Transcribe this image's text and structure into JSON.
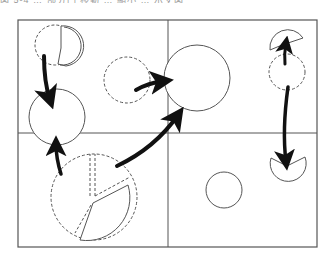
{
  "caption": {
    "text": "図 5-4 … 部分円 移動 … 縮小 … 示す図"
  },
  "diagram": {
    "type": "circle-transition-diagram",
    "frame": {
      "x": 18,
      "y": 20,
      "w": 299,
      "h": 227
    },
    "dividers": {
      "vertical_x": 168,
      "horizontal_y": 133
    },
    "colors": {
      "stroke": "#555555",
      "arrow": "#111111",
      "background": "#ffffff"
    },
    "shapes": [
      {
        "id": "tl-dashed-circle",
        "kind": "dashed-circle",
        "cx": 55,
        "cy": 45,
        "r": 20
      },
      {
        "id": "tl-pie-piece",
        "kind": "solid-sector"
      },
      {
        "id": "left-circle",
        "kind": "solid-circle",
        "cx": 57,
        "cy": 117,
        "r": 28
      },
      {
        "id": "mid-dashed-circle",
        "kind": "dashed-circle",
        "cx": 127,
        "cy": 80,
        "r": 23
      },
      {
        "id": "big-circle",
        "kind": "solid-circle",
        "cx": 197,
        "cy": 78,
        "r": 33
      },
      {
        "id": "big-pie-dashed",
        "kind": "dashed-circle",
        "cx": 94,
        "cy": 197,
        "r": 43
      },
      {
        "id": "big-pie-sector",
        "kind": "solid-sector"
      },
      {
        "id": "big-pie-wedge",
        "kind": "dashed-wedge"
      },
      {
        "id": "small-circle",
        "kind": "solid-circle",
        "cx": 224,
        "cy": 190,
        "r": 18
      },
      {
        "id": "tr-dashed-circle",
        "kind": "dashed-circle",
        "cx": 287,
        "cy": 72,
        "r": 18
      },
      {
        "id": "tr-fan",
        "kind": "solid-sector"
      },
      {
        "id": "br-pacman",
        "kind": "solid-sector"
      }
    ],
    "arrows": [
      {
        "id": "arrow-tl-to-left",
        "from": "tl-pie-piece",
        "to": "left-circle"
      },
      {
        "id": "arrow-pie-to-left",
        "from": "big-pie-sector",
        "to": "left-circle"
      },
      {
        "id": "arrow-dashed-to-big",
        "from": "mid-dashed-circle",
        "to": "big-circle"
      },
      {
        "id": "arrow-pie-to-big",
        "from": "big-pie-sector",
        "to": "big-circle"
      },
      {
        "id": "arrow-tr-up",
        "from": "tr-dashed-circle",
        "to": "tr-fan"
      },
      {
        "id": "arrow-tr-down",
        "from": "tr-dashed-circle",
        "to": "br-pacman"
      }
    ]
  }
}
